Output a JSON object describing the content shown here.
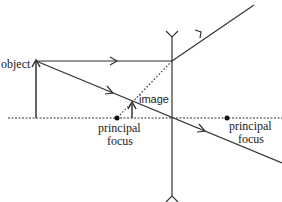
{
  "diagram": {
    "type": "ray diagram - diverging (concave) lens",
    "colors": {
      "line": "#333333",
      "background": "#ffffff"
    },
    "labels": {
      "object": "object",
      "image": "image",
      "focus_left_line1": "principal",
      "focus_left_line2": "focus",
      "focus_right_line1": "principal",
      "focus_right_line2": "focus"
    },
    "elements": [
      {
        "name": "principal-axis",
        "style": "dotted"
      },
      {
        "name": "concave-lens",
        "style": "vertical line with outward arrowheads"
      },
      {
        "name": "object-arrow",
        "direction": "up"
      },
      {
        "name": "image-arrow",
        "direction": "up",
        "style": "virtual, upright, diminished"
      },
      {
        "name": "parallel-ray",
        "description": "parallel to axis, diverges away from lens"
      },
      {
        "name": "construction-line",
        "style": "dotted",
        "description": "traced back to principal focus"
      },
      {
        "name": "central-ray",
        "description": "passes undeviated through lens centre"
      },
      {
        "name": "focal-point-left",
        "marker": "dot"
      },
      {
        "name": "focal-point-right",
        "marker": "dot"
      }
    ]
  }
}
